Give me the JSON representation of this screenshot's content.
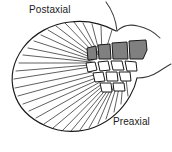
{
  "figure": {
    "background_color": "#ffffff",
    "width": 172,
    "height": 152
  },
  "labels": {
    "postaxial": "Postaxial",
    "preaxial": "Preaxial",
    "font_size_px": 10,
    "text_color": "#1a1a1a"
  },
  "colors": {
    "outline": "#1a1a1a",
    "ray_line": "#2b2b2b",
    "proximal_radial_fill": "#808080",
    "distal_radial_fill": "#ffffff",
    "body_wall_line": "#3a3a3a"
  },
  "anatomy": {
    "fin_web": {
      "name": "fin-web-blade",
      "description": "Rounded fin blade outline with radiating dermal fin rays"
    },
    "fin_rays": {
      "name": "fin-rays",
      "count": 30,
      "description": "Straight lines radiating from the radial cluster to the fin margin"
    },
    "proximal_radials": {
      "name": "proximal-radials",
      "count": 4,
      "fill": "shaded-grey",
      "description": "Upper row of four shaded polygonal radial elements, increasing in size toward the preaxial side"
    },
    "distal_radials": {
      "name": "distal-radials",
      "count": 7,
      "fill": "white",
      "description": "Two lower rows of unshaded polygonal radial elements"
    },
    "body_wall": {
      "name": "body-wall-contour",
      "description": "Curved contour lines at upper right indicating the body wall attachment"
    }
  }
}
